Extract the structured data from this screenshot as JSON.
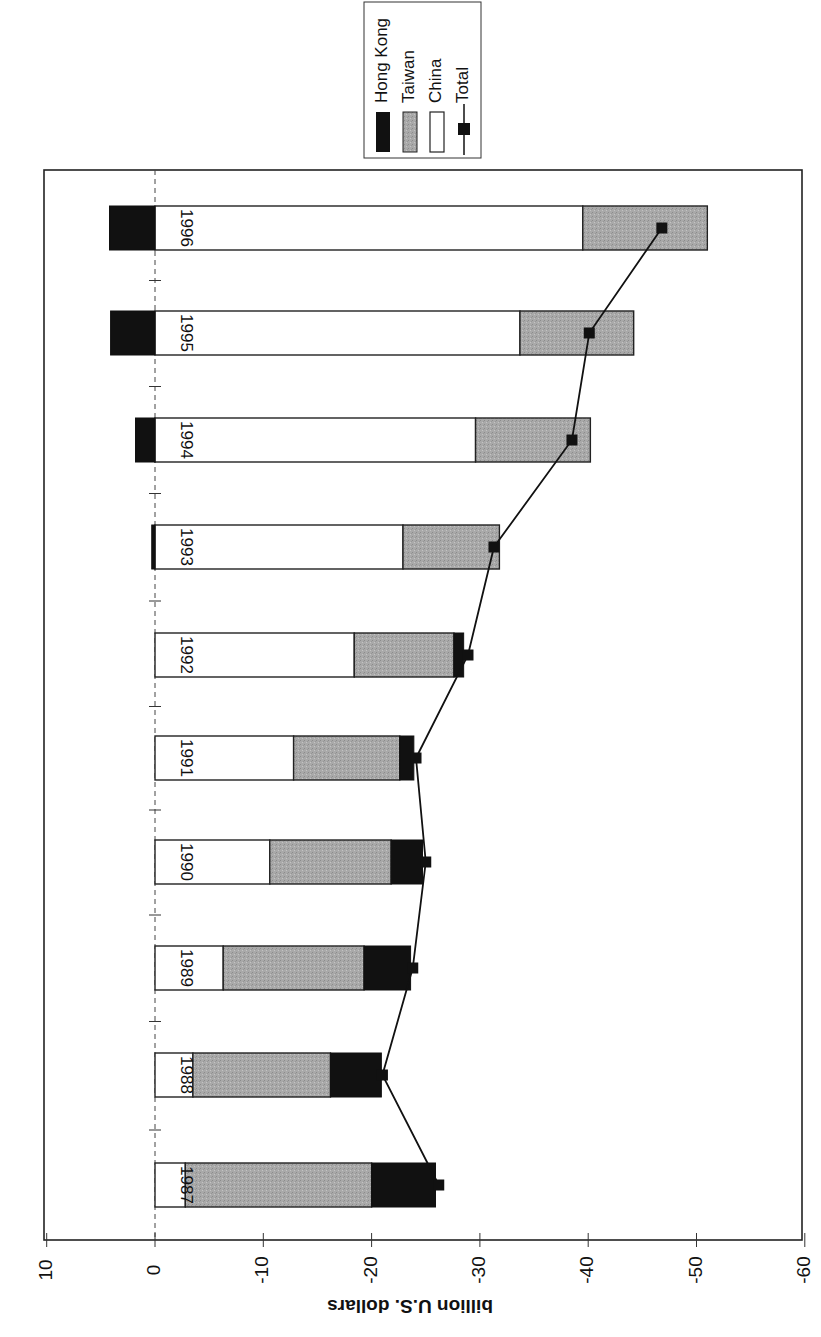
{
  "chart_data": {
    "type": "bar",
    "subtype": "stacked-bar-with-line",
    "orientation": "rotated 90 degrees clockwise (page scanned sideways)",
    "title": "",
    "xlabel": "",
    "ylabel": "billion U.S. dollars",
    "ylim": [
      10,
      -60
    ],
    "yticks": [
      10,
      0,
      -10,
      -20,
      -30,
      -40,
      -50,
      -60
    ],
    "ytick_labels": [
      "10",
      "0",
      "-10",
      "-20",
      "-30",
      "-40",
      "-50",
      "-60"
    ],
    "categories": [
      "1987",
      "1988",
      "1989",
      "1990",
      "1991",
      "1992",
      "1993",
      "1994",
      "1995",
      "1996"
    ],
    "series": [
      {
        "name": "Hong Kong",
        "type": "bar",
        "color": "#111111",
        "values": [
          -5.9,
          -4.7,
          -4.3,
          -2.9,
          -1.3,
          -0.9,
          0.3,
          1.8,
          4.1,
          4.2
        ]
      },
      {
        "name": "Taiwan",
        "type": "bar",
        "color": "#a8a8a8",
        "values": [
          -17.2,
          -12.7,
          -13.0,
          -11.2,
          -9.8,
          -9.2,
          -8.9,
          -10.6,
          -10.5,
          -11.5
        ]
      },
      {
        "name": "China",
        "type": "bar",
        "color": "#ffffff",
        "values": [
          -2.8,
          -3.5,
          -6.3,
          -10.6,
          -12.8,
          -18.4,
          -22.9,
          -29.6,
          -33.7,
          -39.5
        ]
      },
      {
        "name": "Total",
        "type": "line",
        "color": "#111111",
        "marker": "square",
        "values": [
          -26.2,
          -21.0,
          -23.8,
          -25.0,
          -24.1,
          -28.9,
          -31.3,
          -38.5,
          -40.1,
          -46.8
        ]
      }
    ],
    "legend": {
      "position": "top (rotated, outside plot)",
      "entries": [
        "Hong Kong",
        "Taiwan",
        "China",
        "Total"
      ]
    },
    "grid": false,
    "zero_line": "dashed"
  },
  "axis": {
    "title": "billion U.S. dollars",
    "ticks": [
      "10",
      "0",
      "-10",
      "-20",
      "-30",
      "-40",
      "-50",
      "-60"
    ]
  },
  "legend": {
    "items": [
      {
        "label": "Hong Kong",
        "swatch": "solid-black"
      },
      {
        "label": "Taiwan",
        "swatch": "gray"
      },
      {
        "label": "China",
        "swatch": "white"
      },
      {
        "label": "Total",
        "swatch": "line-square-marker"
      }
    ]
  },
  "years": [
    "1987",
    "1988",
    "1989",
    "1990",
    "1991",
    "1992",
    "1993",
    "1994",
    "1995",
    "1996"
  ]
}
